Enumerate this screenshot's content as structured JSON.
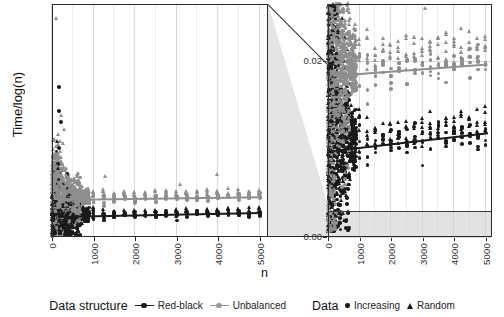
{
  "chart_data": {
    "type": "scatter",
    "title": "",
    "xlabel": "n",
    "ylabel": "Time/log(n)",
    "panels": [
      {
        "name": "overview",
        "xlim": [
          0,
          5200
        ],
        "ylim": [
          0,
          0.115
        ],
        "xticks": [
          "0",
          "1000",
          "2000",
          "3000",
          "4000",
          "5000"
        ],
        "yticks": [],
        "grid": true
      },
      {
        "name": "zoom",
        "xlim": [
          0,
          5200
        ],
        "ylim": [
          0,
          0.0265
        ],
        "xticks": [
          "0",
          "1000",
          "2000",
          "3000",
          "4000",
          "5000"
        ],
        "yticks": [
          "0.00",
          "0.02"
        ],
        "grid": true
      }
    ],
    "legend": {
      "position": "bottom",
      "groups": [
        {
          "title": "Data structure",
          "type": "line",
          "entries": [
            {
              "label": "Red-black",
              "color": "#1a1a1a"
            },
            {
              "label": "Unbalanced",
              "color": "#9a9a9a"
            }
          ]
        },
        {
          "title": "Data",
          "type": "shape",
          "entries": [
            {
              "label": "Increasing",
              "shape": "circle"
            },
            {
              "label": "Random",
              "shape": "triangle"
            }
          ]
        }
      ]
    },
    "series": [
      {
        "name": "Red-black",
        "color": "#1a1a1a",
        "trend": {
          "x": [
            150,
            5050
          ],
          "y": [
            0.0098,
            0.0118
          ]
        }
      },
      {
        "name": "Unbalanced",
        "color": "#8e8e8e",
        "trend": {
          "x": [
            150,
            5050
          ],
          "y": [
            0.0183,
            0.0196
          ]
        }
      }
    ]
  },
  "axis": {
    "y_title": "Time/log(n)",
    "x_title": "n",
    "x_ticks": [
      "0",
      "1000",
      "2000",
      "3000",
      "4000",
      "5000"
    ],
    "right_y_ticks": [
      "0.02",
      "0.00"
    ]
  },
  "colors": {
    "red_black": "#1a1a1a",
    "unbalanced": "#8e8e8e",
    "grid": "#d8d8d8",
    "panel_border": "#2b2b2b",
    "zoom_fill": "#dcdcdc"
  }
}
